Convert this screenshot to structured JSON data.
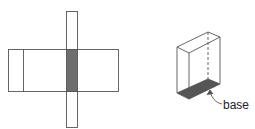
{
  "figure": {
    "left": {
      "description": "net of prism: horizontal strip crossed by vertical strip with shaded base",
      "shade_color": "#6e6e6e",
      "stroke_color": "#444444"
    },
    "right": {
      "description": "3D rectangular prism with shaded base",
      "label": "base",
      "shade_color": "#555555",
      "stroke_color": "#444444"
    }
  }
}
